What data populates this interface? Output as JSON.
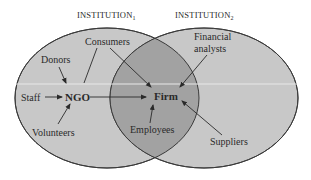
{
  "diagram": {
    "institutions": [
      {
        "label": "INSTITUTION",
        "subscript": "1"
      },
      {
        "label": "INSTITUTION",
        "subscript": "2"
      }
    ],
    "nodes": {
      "ngo": "NGO",
      "firm": "Firm",
      "staff": "Staff",
      "donors": "Donors",
      "volunteers": "Volunteers",
      "consumers": "Consumers",
      "employees": "Employees",
      "financial_analysts_line1": "Financial",
      "financial_analysts_line2": "analysts",
      "suppliers": "Suppliers"
    },
    "edges": [
      {
        "from": "Staff",
        "to": "NGO"
      },
      {
        "from": "Donors",
        "to": "NGO"
      },
      {
        "from": "Volunteers",
        "to": "NGO"
      },
      {
        "from": "Consumers",
        "to": "NGO"
      },
      {
        "from": "Consumers",
        "to": "Firm"
      },
      {
        "from": "NGO",
        "to": "Firm"
      },
      {
        "from": "Employees",
        "to": "Firm"
      },
      {
        "from": "Financial analysts",
        "to": "Firm"
      },
      {
        "from": "Suppliers",
        "to": "Firm"
      }
    ],
    "colors": {
      "ellipse_fill": "#c8c8c8",
      "overlap_fill": "#a2a2a2",
      "stroke": "#3a3a3a",
      "band_line": "#e4e4e4"
    }
  }
}
